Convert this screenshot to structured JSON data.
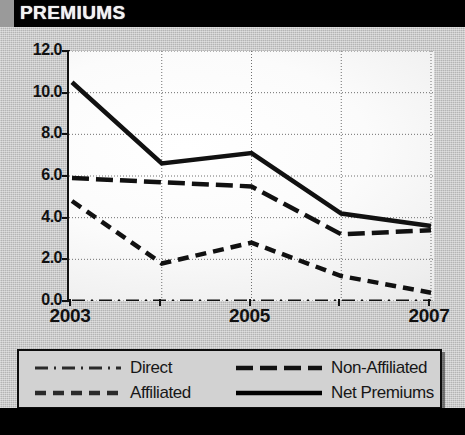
{
  "header": {
    "title": "PREMIUMS"
  },
  "footer": {
    "left_note": "See Sec. 2, B.3",
    "right_note": "$ Millions"
  },
  "legend": {
    "items": [
      {
        "label": "Direct",
        "style": "dash-dot",
        "color": "#2a2a2a"
      },
      {
        "label": "Affiliated",
        "style": "dashed",
        "color": "#2a2a2a"
      },
      {
        "label": "Non-Affiliated",
        "style": "long-dash",
        "color": "#111111"
      },
      {
        "label": "Net Premiums",
        "style": "solid",
        "color": "#000000"
      }
    ]
  },
  "chart_data": {
    "type": "line",
    "title": "PREMIUMS",
    "xlabel": "",
    "ylabel": "",
    "units": "$ Millions",
    "x": [
      2003,
      2004,
      2005,
      2006,
      2007
    ],
    "tick_labels_shown": [
      "2003",
      "",
      "2005",
      "",
      "2007"
    ],
    "ylim": [
      0.0,
      12.0
    ],
    "yticks": [
      0.0,
      2.0,
      4.0,
      6.0,
      8.0,
      10.0,
      12.0
    ],
    "ytick_labels": [
      "0.0",
      "2.0",
      "4.0",
      "6.0",
      "8.0",
      "10.0",
      "12.0"
    ],
    "grid": true,
    "legend_position": "below-plot",
    "series": [
      {
        "name": "Net Premiums",
        "style": "solid",
        "values": [
          10.5,
          6.6,
          7.1,
          4.2,
          3.6
        ]
      },
      {
        "name": "Non-Affiliated",
        "style": "long-dash",
        "values": [
          5.9,
          5.7,
          5.5,
          3.2,
          3.4
        ]
      },
      {
        "name": "Affiliated",
        "style": "dashed",
        "values": [
          4.8,
          1.8,
          2.8,
          1.2,
          0.4
        ]
      },
      {
        "name": "Direct",
        "style": "dash-dot",
        "values": [
          0.0,
          0.0,
          0.0,
          0.0,
          0.0
        ]
      }
    ]
  }
}
